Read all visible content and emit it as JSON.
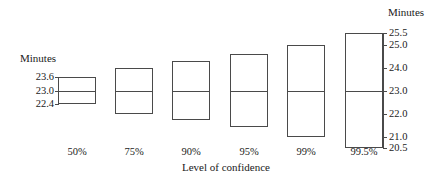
{
  "chart_data": {
    "type": "bar",
    "title": "",
    "xlabel": "Level of confidence",
    "ylabel": "Minutes",
    "ylabel_right": "Minutes",
    "categories": [
      "50%",
      "75%",
      "90%",
      "95%",
      "99%",
      "99.5%"
    ],
    "center": 23.0,
    "series": [
      {
        "name": "Confidence interval",
        "lower": [
          22.4,
          22.0,
          21.7,
          21.4,
          21.0,
          20.5
        ],
        "upper": [
          23.6,
          24.0,
          24.3,
          24.6,
          25.0,
          25.5
        ]
      }
    ],
    "left_axis_ticks": [
      "23.6",
      "23.0",
      "22.4"
    ],
    "left_axis_tick_values": [
      23.6,
      23.0,
      22.4
    ],
    "right_axis_ticks": [
      "25.5",
      "25.0",
      "24.0",
      "23.0",
      "22.0",
      "21.0",
      "20.5"
    ],
    "right_axis_tick_values": [
      25.5,
      25.0,
      24.0,
      23.0,
      22.0,
      21.0,
      20.5
    ],
    "ylim": [
      20.5,
      25.5
    ],
    "grid": false,
    "legend": "none",
    "box_color": "#4a4a4a"
  }
}
